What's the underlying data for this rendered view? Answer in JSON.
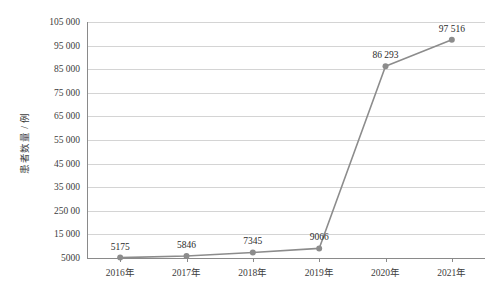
{
  "chart_data": {
    "type": "line",
    "title": "",
    "subtitle": "",
    "xlabel": "",
    "ylabel": "患者数量 / 例",
    "categories": [
      "2016年",
      "2017年",
      "2018年",
      "2019年",
      "2020年",
      "2021年"
    ],
    "values": [
      5175,
      5846,
      7345,
      9066,
      86293,
      97516
    ],
    "point_labels": [
      "5175",
      "5846",
      "7345",
      "9066",
      "86 293",
      "97 516"
    ],
    "series": [
      {
        "name": "患者数量",
        "values": [
          5175,
          5846,
          7345,
          9066,
          86293,
          97516
        ],
        "color": "#8c8c8c",
        "marker": "circle"
      }
    ],
    "ylim": [
      5000,
      105000
    ],
    "ytick_values": [
      5000,
      15000,
      25000,
      35000,
      45000,
      55000,
      65000,
      75000,
      85000,
      95000,
      105000
    ],
    "ytick_labels": [
      "5000",
      "15 000",
      "250 00",
      "35 000",
      "45 000",
      "55 000",
      "65 000",
      "75 000",
      "85 000",
      "95 000",
      "105 000"
    ],
    "grid": true,
    "grid_axis": "y",
    "legend": false,
    "legend_position": "none",
    "colors": {
      "line": "#8c8c8c",
      "marker": "#8c8c8c",
      "grid": "#d4d4d4",
      "axis": "#8a8a8a",
      "text": "#3c3c3c",
      "background": "#ffffff"
    }
  }
}
